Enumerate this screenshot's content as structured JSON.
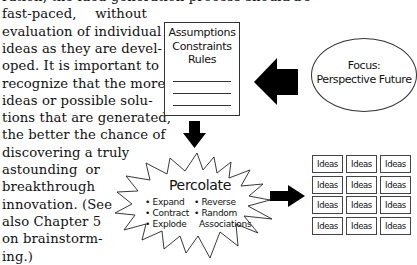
{
  "body_text": {
    "lines": [
      "ration, the idea-generation process should be",
      "fast-paced,   without",
      "evaluation of individual",
      "ideas as they are devel-",
      "oped. It is important to",
      "recognize that the more",
      "ideas or possible solu-",
      "tions that are generated,",
      "the better the chance of",
      "discovering  a  truly",
      "astounding   or",
      "breakthrough",
      "innovation. (See",
      "also Chapter 5",
      "on  brainstorm-",
      "ing.)"
    ]
  },
  "diagram": {
    "constraints_box": {
      "lines": [
        "Assumptions",
        "Constraints",
        "Rules"
      ]
    },
    "focus_ellipse": {
      "lines": [
        "Focus:",
        "Perspective Future"
      ]
    },
    "percolate": {
      "title": "Percolate",
      "left_items": [
        "• Expand",
        "• Contract",
        "• Explode"
      ],
      "right_items": [
        "• Reverse",
        "• Random",
        "Associations"
      ]
    },
    "ideas_grid": {
      "cells": [
        "Ideas",
        "Ideas",
        "Ideas",
        "Ideas",
        "Ideas",
        "Ideas",
        "Ideas",
        "Ideas",
        "Ideas",
        "Ideas",
        "Ideas",
        "Ideas"
      ]
    },
    "arrows": [
      "arrow-left",
      "arrow-down",
      "arrow-right"
    ]
  }
}
